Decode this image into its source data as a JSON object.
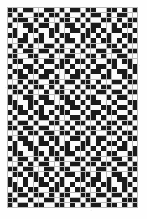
{
  "figure": {
    "name": "binary-matrix-pattern",
    "kind": "bitmap-grid",
    "background_color": "#fefefe",
    "grid_line_color": "#b9b9b9",
    "dark_cell_color": "#1b1b1b",
    "light_cell_color": "#fbfbfb",
    "mid_cell_color": "#8e8e8e",
    "columns": 25,
    "rows": 39,
    "cell_size_px": 5.24,
    "origin_x_px": 7,
    "origin_y_px": 7,
    "width_px": 131,
    "height_px": 201
  },
  "chart_data": {
    "type": "heatmap",
    "title": "",
    "xlabel": "",
    "ylabel": "",
    "legend": [],
    "grid": true,
    "columns": 25,
    "rows": 39,
    "value_legend": {
      "0": "light",
      "1": "dark",
      "2": "mid"
    },
    "matrix": [
      [
        1,
        1,
        0,
        1,
        1,
        0,
        0,
        1,
        1,
        0,
        1,
        0,
        1,
        1,
        0,
        1,
        1,
        0,
        0,
        1,
        1,
        0,
        1,
        0,
        1
      ],
      [
        1,
        0,
        1,
        0,
        0,
        1,
        1,
        0,
        1,
        1,
        0,
        1,
        0,
        0,
        1,
        0,
        1,
        1,
        0,
        1,
        0,
        1,
        1,
        0,
        0
      ],
      [
        0,
        1,
        1,
        1,
        0,
        1,
        0,
        1,
        0,
        0,
        1,
        1,
        0,
        1,
        0,
        1,
        0,
        0,
        1,
        1,
        0,
        1,
        0,
        1,
        1
      ],
      [
        1,
        0,
        0,
        1,
        1,
        0,
        1,
        1,
        0,
        1,
        0,
        1,
        1,
        0,
        1,
        0,
        1,
        1,
        0,
        0,
        1,
        0,
        1,
        1,
        0
      ],
      [
        0,
        1,
        0,
        0,
        1,
        1,
        0,
        0,
        1,
        1,
        0,
        0,
        1,
        1,
        0,
        1,
        1,
        0,
        1,
        0,
        1,
        1,
        0,
        0,
        1
      ],
      [
        1,
        1,
        0,
        1,
        0,
        0,
        1,
        0,
        1,
        0,
        1,
        1,
        0,
        0,
        1,
        1,
        0,
        1,
        0,
        1,
        0,
        0,
        1,
        1,
        0
      ],
      [
        0,
        0,
        1,
        1,
        0,
        1,
        1,
        0,
        0,
        1,
        0,
        1,
        1,
        0,
        1,
        0,
        1,
        0,
        1,
        1,
        0,
        1,
        0,
        1,
        1
      ],
      [
        1,
        0,
        1,
        0,
        1,
        0,
        0,
        1,
        1,
        0,
        1,
        0,
        0,
        1,
        0,
        1,
        1,
        0,
        0,
        1,
        1,
        0,
        1,
        0,
        0
      ],
      [
        0,
        1,
        0,
        1,
        1,
        0,
        1,
        1,
        0,
        1,
        1,
        0,
        1,
        0,
        1,
        0,
        0,
        1,
        1,
        0,
        1,
        1,
        0,
        1,
        1
      ],
      [
        1,
        1,
        0,
        0,
        1,
        1,
        0,
        0,
        1,
        0,
        0,
        1,
        1,
        0,
        0,
        1,
        1,
        0,
        1,
        0,
        0,
        1,
        1,
        0,
        0
      ],
      [
        0,
        1,
        1,
        0,
        0,
        1,
        0,
        1,
        1,
        0,
        1,
        1,
        0,
        1,
        1,
        0,
        1,
        0,
        0,
        1,
        1,
        0,
        1,
        1,
        0
      ],
      [
        1,
        0,
        0,
        1,
        1,
        0,
        1,
        0,
        0,
        1,
        1,
        0,
        1,
        0,
        0,
        1,
        0,
        1,
        1,
        0,
        1,
        0,
        0,
        1,
        1
      ],
      [
        0,
        1,
        1,
        0,
        1,
        1,
        0,
        1,
        1,
        0,
        0,
        1,
        0,
        1,
        1,
        0,
        1,
        1,
        0,
        1,
        0,
        1,
        1,
        0,
        1
      ],
      [
        1,
        0,
        1,
        1,
        0,
        0,
        1,
        1,
        0,
        1,
        0,
        0,
        1,
        1,
        0,
        1,
        0,
        0,
        1,
        1,
        0,
        0,
        1,
        1,
        0
      ],
      [
        0,
        0,
        1,
        0,
        1,
        1,
        0,
        0,
        1,
        1,
        0,
        1,
        1,
        0,
        1,
        1,
        0,
        1,
        0,
        0,
        1,
        1,
        0,
        1,
        1
      ],
      [
        1,
        1,
        0,
        1,
        0,
        1,
        1,
        0,
        1,
        0,
        1,
        0,
        0,
        1,
        0,
        1,
        1,
        0,
        1,
        1,
        0,
        0,
        1,
        0,
        0
      ],
      [
        0,
        1,
        1,
        0,
        1,
        0,
        0,
        1,
        0,
        1,
        1,
        0,
        1,
        0,
        1,
        0,
        0,
        1,
        1,
        0,
        1,
        1,
        0,
        1,
        1
      ],
      [
        1,
        0,
        0,
        1,
        1,
        0,
        1,
        1,
        0,
        0,
        1,
        1,
        0,
        1,
        0,
        1,
        1,
        0,
        0,
        1,
        0,
        1,
        1,
        0,
        0
      ],
      [
        1,
        1,
        0,
        0,
        1,
        1,
        0,
        1,
        1,
        0,
        0,
        1,
        1,
        0,
        1,
        0,
        1,
        1,
        0,
        0,
        1,
        0,
        0,
        1,
        1
      ],
      [
        0,
        1,
        1,
        0,
        1,
        0,
        1,
        0,
        0,
        1,
        1,
        0,
        1,
        1,
        0,
        1,
        0,
        0,
        1,
        1,
        0,
        1,
        1,
        0,
        1
      ],
      [
        1,
        0,
        1,
        1,
        0,
        1,
        1,
        0,
        1,
        0,
        1,
        1,
        0,
        0,
        1,
        0,
        1,
        1,
        0,
        1,
        1,
        0,
        0,
        1,
        0
      ],
      [
        0,
        1,
        0,
        0,
        1,
        0,
        1,
        1,
        0,
        1,
        0,
        0,
        1,
        1,
        0,
        1,
        1,
        0,
        1,
        0,
        0,
        1,
        1,
        0,
        1
      ],
      [
        1,
        0,
        1,
        1,
        0,
        1,
        0,
        0,
        1,
        1,
        0,
        1,
        0,
        1,
        1,
        0,
        0,
        1,
        0,
        1,
        1,
        0,
        1,
        1,
        0
      ],
      [
        1,
        1,
        0,
        1,
        1,
        0,
        1,
        1,
        0,
        0,
        1,
        0,
        1,
        0,
        0,
        1,
        1,
        0,
        1,
        1,
        0,
        1,
        0,
        0,
        1
      ],
      [
        0,
        0,
        1,
        0,
        1,
        1,
        0,
        1,
        1,
        0,
        1,
        1,
        0,
        1,
        1,
        0,
        1,
        0,
        0,
        1,
        1,
        0,
        1,
        1,
        0
      ],
      [
        1,
        0,
        1,
        1,
        0,
        0,
        1,
        0,
        1,
        1,
        0,
        0,
        1,
        1,
        0,
        1,
        0,
        1,
        1,
        0,
        0,
        1,
        0,
        1,
        1
      ],
      [
        0,
        1,
        0,
        1,
        1,
        0,
        1,
        1,
        0,
        1,
        0,
        1,
        0,
        0,
        1,
        1,
        0,
        1,
        0,
        1,
        1,
        0,
        1,
        0,
        0
      ],
      [
        1,
        1,
        0,
        0,
        1,
        1,
        0,
        0,
        1,
        0,
        1,
        1,
        0,
        1,
        1,
        0,
        1,
        0,
        1,
        0,
        0,
        1,
        1,
        0,
        1
      ],
      [
        0,
        1,
        1,
        0,
        0,
        1,
        1,
        0,
        1,
        1,
        0,
        1,
        1,
        0,
        0,
        1,
        0,
        1,
        0,
        1,
        1,
        0,
        0,
        1,
        1
      ],
      [
        1,
        0,
        1,
        1,
        0,
        1,
        0,
        1,
        0,
        1,
        1,
        0,
        0,
        1,
        1,
        0,
        1,
        1,
        0,
        0,
        1,
        1,
        0,
        1,
        0
      ],
      [
        0,
        0,
        1,
        0,
        1,
        0,
        1,
        1,
        0,
        0,
        1,
        0,
        1,
        1,
        0,
        1,
        1,
        0,
        1,
        1,
        0,
        1,
        1,
        0,
        1
      ],
      [
        1,
        1,
        0,
        1,
        1,
        0,
        0,
        1,
        1,
        0,
        1,
        1,
        0,
        0,
        1,
        0,
        0,
        1,
        1,
        0,
        1,
        0,
        0,
        1,
        1
      ],
      [
        0,
        1,
        1,
        0,
        1,
        1,
        0,
        1,
        0,
        1,
        0,
        1,
        1,
        0,
        1,
        1,
        0,
        1,
        0,
        0,
        1,
        1,
        0,
        1,
        0
      ],
      [
        1,
        0,
        0,
        1,
        0,
        1,
        1,
        0,
        1,
        0,
        1,
        0,
        0,
        1,
        1,
        0,
        1,
        1,
        0,
        1,
        0,
        1,
        1,
        0,
        1
      ],
      [
        1,
        1,
        0,
        1,
        0,
        0,
        1,
        1,
        0,
        1,
        1,
        0,
        1,
        0,
        0,
        1,
        1,
        0,
        1,
        1,
        0,
        0,
        1,
        1,
        0
      ],
      [
        0,
        1,
        1,
        0,
        1,
        1,
        0,
        0,
        1,
        1,
        0,
        1,
        0,
        1,
        1,
        0,
        0,
        1,
        0,
        1,
        1,
        0,
        1,
        0,
        1
      ],
      [
        1,
        0,
        1,
        1,
        0,
        1,
        1,
        0,
        1,
        0,
        1,
        1,
        0,
        0,
        1,
        1,
        0,
        1,
        1,
        0,
        1,
        1,
        0,
        1,
        0
      ],
      [
        1,
        1,
        0,
        0,
        1,
        0,
        0,
        1,
        1,
        0,
        1,
        0,
        1,
        1,
        0,
        1,
        1,
        0,
        0,
        1,
        0,
        0,
        1,
        1,
        1
      ],
      [
        1,
        0,
        1,
        1,
        0,
        1,
        1,
        0,
        0,
        1,
        1,
        0,
        1,
        0,
        1,
        0,
        1,
        1,
        0,
        1,
        1,
        0,
        1,
        0,
        1
      ]
    ]
  }
}
